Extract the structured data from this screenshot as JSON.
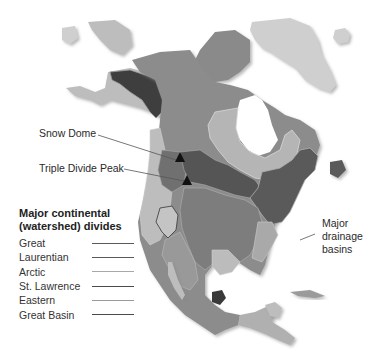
{
  "map": {
    "title": "Major continental (watershed) divides of North America",
    "annotations": {
      "snow_dome": "Snow Dome",
      "triple_divide_peak": "Triple Divide Peak",
      "drainage_basins_line1": "Major",
      "drainage_basins_line2": "drainage",
      "drainage_basins_line3": "basins"
    },
    "markers": [
      {
        "name": "Snow Dome",
        "x": 180,
        "y": 158,
        "icon": "triangle-marker"
      },
      {
        "name": "Triple Divide Peak",
        "x": 187,
        "y": 180,
        "icon": "triangle-marker"
      }
    ]
  },
  "legend": {
    "title_line1": "Major continental",
    "title_line2": "(watershed) divides",
    "items": [
      {
        "label": "Great",
        "color": "#5a5a5a"
      },
      {
        "label": "Laurentian",
        "color": "#5a5a5a"
      },
      {
        "label": "Arctic",
        "color": "#a8a8a8"
      },
      {
        "label": "St. Lawrence",
        "color": "#4a4a4a"
      },
      {
        "label": "Eastern",
        "color": "#9a9a9a"
      },
      {
        "label": "Great Basin",
        "color": "#4a4a4a"
      }
    ]
  },
  "colors": {
    "ocean": "#ffffff",
    "greenland": "#cfcfcf",
    "arctic_islands": "#8a8a8a",
    "pacific_basin_dark": "#4a4a4a",
    "arctic_basin": "#8c8c8c",
    "hudson_basin": "#b5b5b5",
    "atlantic_dark": "#5d5d5d",
    "mississippi": "#858585",
    "gulf": "#a9a9a9",
    "pacific_light": "#bdbdbd",
    "great_basin": "#c4c4c4"
  }
}
